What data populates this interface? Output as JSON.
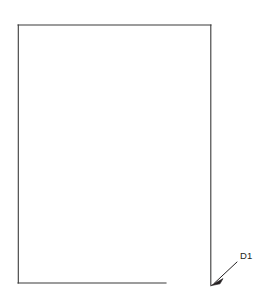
{
  "figure": {
    "background_color": "#ffffff",
    "line_color": "#3a3a3a",
    "label_color": "#231f20",
    "canvas": {
      "width": 265,
      "height": 296
    }
  },
  "shape": {
    "name": "panel-outline",
    "kind": "rectangle-outline",
    "left": 18,
    "top": 25,
    "right": 211,
    "bottom": 283,
    "stroke_width": 1.1,
    "edges": {
      "top": {
        "x1": 18,
        "y1": 25,
        "x2": 211,
        "y2": 25
      },
      "left": {
        "x1": 18,
        "y1": 25,
        "x2": 18,
        "y2": 283
      },
      "right": {
        "x1": 211,
        "y1": 25,
        "x2": 211,
        "y2": 285
      },
      "bottom": {
        "x1": 18,
        "y1": 283,
        "x2": 166,
        "y2": 283
      }
    }
  },
  "annotation": {
    "label": "D1",
    "label_x": 240,
    "label_y": 259,
    "leader": {
      "x1": 237,
      "y1": 262,
      "x2": 213,
      "y2": 284
    },
    "arrowhead": {
      "tip_x": 211,
      "tip_y": 285,
      "points": "211,285.5 222,279.5 219.5,283.5"
    }
  }
}
